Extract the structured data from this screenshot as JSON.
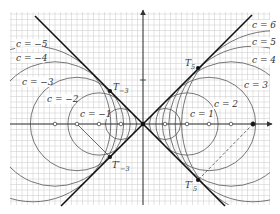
{
  "figure": {
    "origin_px": [
      143,
      124
    ],
    "unit_px": 22,
    "grid": {
      "x0": 10,
      "y0": 12,
      "x1": 270,
      "y1": 205,
      "minor_px": 5.5,
      "color": "#c8c8c8"
    },
    "axes": {
      "x_label": "X",
      "y_label": "Y",
      "x_tick_label": "2",
      "y_tick_label": "2"
    },
    "envelope_lines": [
      {
        "name": "line-y-eq-x",
        "slope": 1
      },
      {
        "name": "line-y-eq-neg-x",
        "slope": -1
      }
    ],
    "circles": [
      {
        "c": -5,
        "label": "c = −5",
        "lx": 16,
        "ly": 47
      },
      {
        "c": -4,
        "label": "c = −4",
        "lx": 16,
        "ly": 61
      },
      {
        "c": -3,
        "label": "c = −3",
        "lx": 22,
        "ly": 85
      },
      {
        "c": -2,
        "label": "c = −2",
        "lx": 47,
        "ly": 102
      },
      {
        "c": -1,
        "label": "c = −1",
        "lx": 80,
        "ly": 117
      },
      {
        "c": 1,
        "label": "c = 1",
        "lx": 190,
        "ly": 117
      },
      {
        "c": 2,
        "label": "c = 2",
        "lx": 214,
        "ly": 107
      },
      {
        "c": 3,
        "label": "c = 3",
        "lx": 244,
        "ly": 88
      },
      {
        "c": 4,
        "label": "c = 4",
        "lx": 252,
        "ly": 63
      },
      {
        "c": 5,
        "label": "c = 5",
        "lx": 252,
        "ly": 45
      },
      {
        "c": 6,
        "label": "c = 6",
        "lx": 252,
        "ly": 28
      }
    ],
    "tangent_points": [
      {
        "name": "T5",
        "label": "T",
        "sub": "5",
        "x": 198,
        "y": 68,
        "lx": 185,
        "ly": 66
      },
      {
        "name": "T5-prime",
        "label": "T′",
        "sub": "5",
        "x": 198,
        "y": 180,
        "lx": 185,
        "ly": 188
      },
      {
        "name": "T-3",
        "label": "T",
        "sub": "−3",
        "x": 110,
        "y": 91,
        "lx": 113,
        "ly": 90
      },
      {
        "name": "T-3-prime",
        "label": "T′",
        "sub": "−3",
        "x": 110,
        "y": 157,
        "lx": 112,
        "ly": 168
      }
    ],
    "axis_markers_c": [
      -4,
      -3,
      -2,
      -1,
      1,
      2,
      3,
      4,
      5
    ],
    "colors": {
      "envelope": "#111111",
      "circle": "#555555",
      "axis": "#333333"
    }
  }
}
